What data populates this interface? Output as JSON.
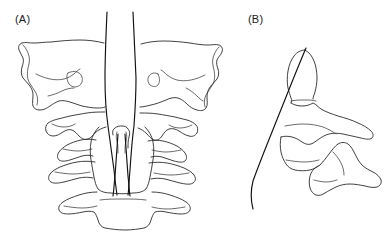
{
  "figure": {
    "type": "anatomical-line-drawing",
    "background_color": "#ffffff",
    "stroke_color": "#2b2b2b",
    "width": 387,
    "height": 242,
    "panels": [
      {
        "id": "A",
        "label": "(A)",
        "view": "anteroposterior",
        "description": "Anteroposterior (open-mouth) view of the craniocervical junction showing the occiput, atlas (C1), axis (C2) with the odontoid process, and lower cervical vertebrae with a pair of instrument trajectory lines converging on the dens",
        "structures": [
          "left occipital condyle and mastoid region",
          "right occipital condyle and mastoid region",
          "atlas C1 lateral masses and transverse processes",
          "axis C2 body and odontoid process (dens)",
          "C3 vertebral body and transverse processes",
          "C4 vertebral body and transverse processes"
        ],
        "trajectory": {
          "name": "anterior odontoid screw trajectory",
          "count": 2,
          "orientation": "vertical-converging"
        }
      },
      {
        "id": "B",
        "label": "(B)",
        "view": "lateral",
        "description": "Lateral view of the axis (C2) showing the odontoid process, vertebral body, inferior articular process and spinous process, with a single oblique screw trajectory entering the anteroinferior body and exiting at the dens apex",
        "structures": [
          "odontoid process (dens)",
          "C2 vertebral body",
          "superior articular surface",
          "pars interarticularis",
          "spinous process"
        ],
        "trajectory": {
          "name": "anterior odontoid screw trajectory",
          "count": 1,
          "orientation": "oblique"
        }
      }
    ]
  }
}
